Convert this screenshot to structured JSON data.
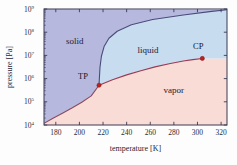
{
  "chart_data": {
    "type": "line",
    "title": "",
    "xlabel": "temperature [K]",
    "ylabel": "pressure [Pa]",
    "xlim": [
      170,
      325
    ],
    "ylim": [
      10000,
      1000000000
    ],
    "yscale": "log",
    "xscale": "linear",
    "grid": false,
    "legend": null,
    "xticks": [
      180,
      200,
      220,
      240,
      260,
      280,
      300,
      320
    ],
    "xtick_labels": [
      "180",
      "200",
      "220",
      "240",
      "260",
      "280",
      "300",
      "320"
    ],
    "yticks": [
      10000,
      100000,
      1000000,
      10000000,
      100000000,
      1000000000
    ],
    "ytick_labels": [
      "10",
      "10",
      "10",
      "10",
      "10",
      "10"
    ],
    "ytick_exponents": [
      "4",
      "5",
      "6",
      "7",
      "8",
      "9"
    ],
    "regions": [
      {
        "name": "solid",
        "label": "solid",
        "color": "#b6b9dd",
        "label_x": 196,
        "label_y": 30000000
      },
      {
        "name": "liquid",
        "label": "liquid",
        "color": "#c8dcef",
        "label_x": 258,
        "label_y": 13000000
      },
      {
        "name": "vapor",
        "label": "vapor",
        "color": "#f9dcd6",
        "label_x": 280,
        "label_y": 230000
      }
    ],
    "annotations": [
      {
        "name": "triple-point",
        "label": "TP",
        "x": 216.6,
        "y": 518000,
        "marker": "dot",
        "color": "#c02020",
        "label_dx": -16,
        "label_dy": -6
      },
      {
        "name": "critical-point",
        "label": "CP",
        "x": 304.1,
        "y": 7380000,
        "marker": "dot",
        "color": "#c02020",
        "label_dx": -4,
        "label_dy": -9
      }
    ],
    "curves": [
      {
        "name": "sublimation-curve",
        "label": "sublimation",
        "color": "#8a4a63",
        "points": [
          [
            170,
            11800
          ],
          [
            178,
            20000
          ],
          [
            186,
            33000
          ],
          [
            194,
            55000
          ],
          [
            202,
            96000
          ],
          [
            210,
            180000
          ],
          [
            216.6,
            518000
          ]
        ]
      },
      {
        "name": "melting-curve",
        "label": "melting",
        "color": "#4a4a7a",
        "points": [
          [
            216.6,
            518000
          ],
          [
            217.4,
            3000000
          ],
          [
            218.6,
            9000000
          ],
          [
            221,
            25000000
          ],
          [
            225,
            55000000
          ],
          [
            232,
            110000000
          ],
          [
            244,
            210000000
          ],
          [
            262,
            350000000
          ],
          [
            288,
            550000000
          ],
          [
            312,
            790000000
          ],
          [
            325,
            930000000
          ]
        ]
      },
      {
        "name": "vaporization-curve",
        "label": "vaporization",
        "color": "#9a3a52",
        "points": [
          [
            216.6,
            518000
          ],
          [
            228,
            890000
          ],
          [
            240,
            1450000
          ],
          [
            252,
            2200000
          ],
          [
            264,
            3200000
          ],
          [
            276,
            4400000
          ],
          [
            288,
            5700000
          ],
          [
            296,
            6600000
          ],
          [
            304.1,
            7380000
          ]
        ]
      }
    ]
  },
  "axes": {
    "x_title": "temperature [K]",
    "y_title": "pressure [Pa]",
    "frame_color": "#3a3a55"
  }
}
